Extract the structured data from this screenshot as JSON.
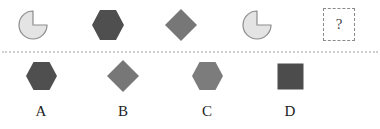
{
  "puzzle": {
    "question_mark": "?",
    "colors": {
      "pie_fill": "#e4e4e4",
      "pie_stroke": "#8c8c8c",
      "dark_hexagon": "#4f4f4f",
      "diamond": "#777777",
      "light_hexagon": "#7c7c7c",
      "dark_square": "#4c4c4c",
      "divider": "#cfcfcf"
    },
    "sequence": [
      {
        "shape": "pie-three-quarter",
        "fill": "light-gray"
      },
      {
        "shape": "hexagon",
        "fill": "dark-gray"
      },
      {
        "shape": "diamond",
        "fill": "medium-gray"
      },
      {
        "shape": "pie-three-quarter",
        "fill": "light-gray"
      },
      {
        "shape": "unknown",
        "label": "?"
      }
    ],
    "options": [
      {
        "label": "A",
        "shape": "hexagon",
        "fill": "dark-gray"
      },
      {
        "label": "B",
        "shape": "diamond",
        "fill": "medium-gray"
      },
      {
        "label": "C",
        "shape": "hexagon",
        "fill": "medium-gray"
      },
      {
        "label": "D",
        "shape": "square",
        "fill": "dark-gray"
      }
    ]
  }
}
